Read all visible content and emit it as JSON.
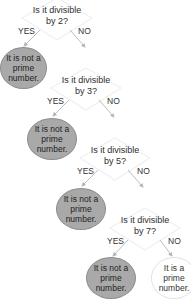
{
  "diagram": {
    "type": "decision-tree",
    "colors": {
      "not_prime_fill": "#a9a9a9",
      "prime_fill": "#ffffff",
      "diamond_stroke": "#f0f0f0",
      "arrow": "#b5b5b5"
    },
    "questions": [
      {
        "line1": "Is it divisible",
        "line2": "by 2?",
        "yes": "YES",
        "no": "NO"
      },
      {
        "line1": "Is it divisible",
        "line2": "by 3?",
        "yes": "YES",
        "no": "NO"
      },
      {
        "line1": "Is it divisible",
        "line2": "by 5?",
        "yes": "YES",
        "no": "NO"
      },
      {
        "line1": "Is it divisible",
        "line2": "by 7?",
        "yes": "YES",
        "no": "NO"
      }
    ],
    "outcomes": [
      {
        "line1": "It is not a",
        "line2": "prime",
        "line3": "number."
      },
      {
        "line1": "It is not a",
        "line2": "prime",
        "line3": "number."
      },
      {
        "line1": "It is not a",
        "line2": "prime",
        "line3": "number."
      },
      {
        "line1": "It is not a",
        "line2": "prime",
        "line3": "number."
      },
      {
        "line1": "It is a",
        "line2": "prime",
        "line3": "number."
      }
    ]
  }
}
